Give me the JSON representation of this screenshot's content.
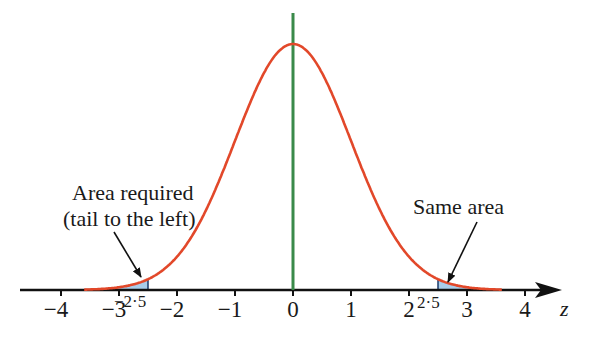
{
  "figure": {
    "type": "normal-distribution-diagram",
    "axis_variable": "z",
    "tick_labels": [
      "−4",
      "−3",
      "−2",
      "−1",
      "0",
      "1",
      "2",
      "3",
      "4"
    ],
    "tick_values": [
      -4,
      -3,
      -2,
      -1,
      0,
      1,
      2,
      3,
      4
    ],
    "left_boundary_label": "−2·5",
    "right_boundary_label": "2·5",
    "left_boundary": -2.5,
    "right_boundary": 2.5,
    "annotation_left_line1": "Area required",
    "annotation_left_line2": "(tail to the left)",
    "annotation_right": "Same area",
    "colors": {
      "curve": "#e2482a",
      "center_line": "#3a8a4a",
      "shaded_area": "#a9cdea",
      "axis": "#111111"
    }
  }
}
